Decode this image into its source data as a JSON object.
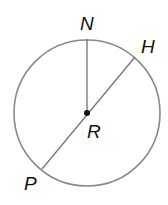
{
  "diagram": {
    "type": "circle-geometry",
    "colors": {
      "circle_stroke": "#8a8a8a",
      "segment_stroke": "#7a7a7a",
      "point_fill": "#111111",
      "label_fill": "#111111",
      "background": "#ffffff"
    },
    "circle": {
      "cx": 87,
      "cy": 113,
      "r": 73,
      "center_label": "R"
    },
    "points": {
      "N": {
        "label": "N",
        "x": 87,
        "y": 39
      },
      "H": {
        "label": "H",
        "x": 135,
        "y": 57
      },
      "P": {
        "label": "P",
        "x": 42,
        "y": 169
      },
      "R": {
        "label": "R",
        "x": 87,
        "y": 113
      }
    },
    "segments": [
      {
        "name": "radius-RN",
        "from": "R",
        "to": "N"
      },
      {
        "name": "diameter-PH",
        "from": "P",
        "to": "H"
      }
    ],
    "labels": {
      "N": "N",
      "H": "H",
      "R": "R",
      "P": "P"
    }
  }
}
